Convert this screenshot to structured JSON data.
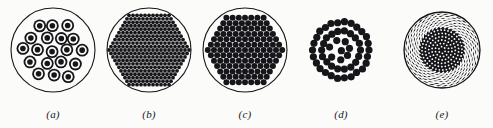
{
  "figure": {
    "kind": "optical-fiber-bundle-cross-sections",
    "background_color": "#fbfbfa",
    "ink_color": "#16161a",
    "width": 493,
    "height": 128,
    "panels": [
      {
        "id": "a",
        "label": "(a)",
        "caption_letter": "a",
        "description": "loosely packed bundle of concentric ring fibers inside a thin outline circle",
        "x": 8,
        "center_x": 53,
        "center_y": 50,
        "outer_radius": 42,
        "has_outer_circle": true,
        "outer_circle_stroke": 1.1,
        "element_type": "ring-with-core",
        "element_count": 21,
        "element_outer_radius": 6.4,
        "element_mid_radius": 4.6,
        "element_core_radius": 2.8,
        "packing": "hex-jittered",
        "fill_color": "#16161a"
      },
      {
        "id": "b",
        "label": "(b)",
        "caption_letter": "b",
        "description": "dense hexagonal array of very small fibers forming a hexagon inside an outline circle",
        "x": 104,
        "center_x": 149,
        "center_y": 50,
        "outer_radius": 42,
        "has_outer_circle": true,
        "outer_circle_stroke": 1.1,
        "element_type": "solid-dot",
        "element_count": 331,
        "element_radius": 1.9,
        "lattice_pitch": 4.0,
        "lattice_rings": 10,
        "packing": "hexagon",
        "fill_color": "#16161a"
      },
      {
        "id": "c",
        "label": "(c)",
        "caption_letter": "c",
        "description": "hexagonal array of larger fibers inside an outline circle",
        "x": 200,
        "center_x": 245,
        "center_y": 50,
        "outer_radius": 42,
        "has_outer_circle": true,
        "outer_circle_stroke": 1.1,
        "element_type": "solid-dot",
        "element_count": 127,
        "element_radius": 3.0,
        "lattice_pitch": 6.2,
        "lattice_rings": 6,
        "packing": "hexagon",
        "fill_color": "#16161a"
      },
      {
        "id": "d",
        "label": "(d)",
        "caption_letter": "d",
        "description": "concentric rings of large fibers with irregular core, no outline circle",
        "x": 296,
        "center_x": 341,
        "center_y": 50,
        "outer_radius": 33,
        "has_outer_circle": false,
        "element_type": "solid-dot",
        "element_count": 52,
        "element_radius": 3.6,
        "packing": "concentric-rings",
        "ring_counts": [
          26,
          18,
          7,
          1
        ],
        "ring_radii": [
          28,
          19,
          10,
          0
        ],
        "fill_color": "#16161a"
      },
      {
        "id": "e",
        "label": "(e)",
        "caption_letter": "e",
        "description": "twisted spiral weave of fine fibers with dark dotted core, filled disc",
        "x": 397,
        "center_x": 442,
        "center_y": 50,
        "outer_radius": 38,
        "has_outer_circle": true,
        "outer_circle_stroke": 1.3,
        "element_type": "spiral-weave",
        "spiral_arms": 34,
        "spiral_turn_deg": 52,
        "core_radius": 22,
        "core_dot_radius": 0.9,
        "fill_color": "#16161a"
      }
    ]
  }
}
